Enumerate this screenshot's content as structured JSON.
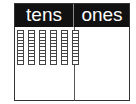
{
  "place_value_chart": {
    "columns": [
      {
        "label": "tens",
        "count": 6
      },
      {
        "label": "ones",
        "count": 0
      }
    ],
    "units_per_rod": 10
  },
  "colors": {
    "header_bg": "#111111",
    "header_text": "#ffffff",
    "border": "#333333"
  }
}
